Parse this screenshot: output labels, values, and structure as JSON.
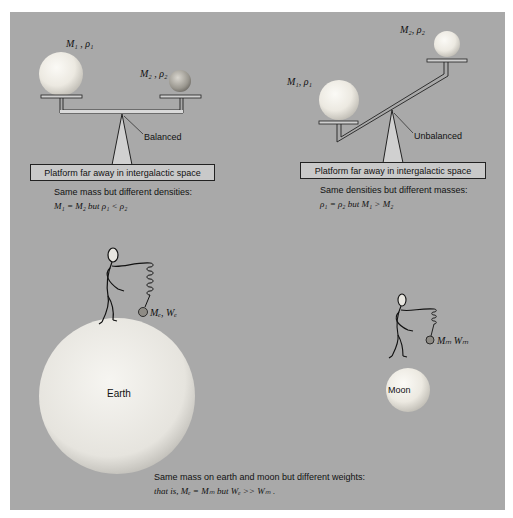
{
  "colors": {
    "panel_bg": "#a9a9a9",
    "platform_bg": "#c9c9c9",
    "sphere_light": "#f4f2ec",
    "line": "#222222"
  },
  "left_balance": {
    "label_m1": "M₁ , ρ₁",
    "label_m2": "M₂ , ρ₂",
    "pointer_label": "Balanced",
    "platform_text": "Platform far away in intergalactic space",
    "caption_line1": "Same mass but different densities:",
    "caption_line2": "M₁ = M₂ but ρ₁ < ρ₂"
  },
  "right_balance": {
    "label_m1": "M₁, ρ₁",
    "label_m2": "M₂, ρ₂",
    "pointer_label": "Unbalanced",
    "platform_text": "Platform far away in intergalactic space",
    "caption_line1": "Same densities but different masses:",
    "caption_line2": "ρ₁ = ρ₂ but M₁ > M₂"
  },
  "earth_scene": {
    "body_label": "Earth",
    "weight_label": "Mₑ, Wₑ"
  },
  "moon_scene": {
    "body_label": "Moon",
    "weight_label": "Mₘ  Wₘ"
  },
  "bottom_caption": {
    "line1": "Same mass on earth and moon but different weights:",
    "line2": "that is, Mₑ = Mₘ but Wₑ >> Wₘ ."
  }
}
